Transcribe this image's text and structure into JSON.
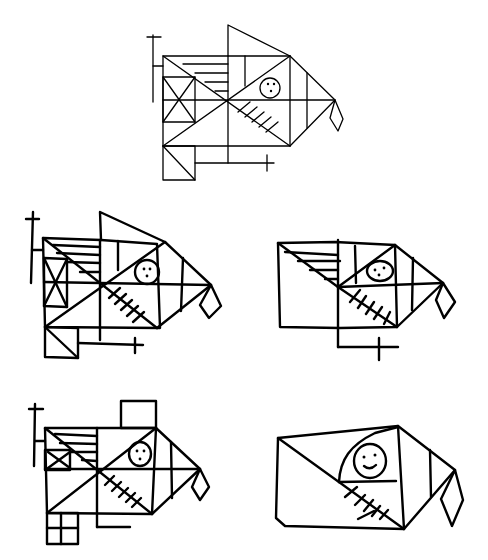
{
  "figure": {
    "title": "",
    "stroke_color": "#000000",
    "background": "#ffffff",
    "panels": [
      {
        "id": "model",
        "label": "",
        "position": "top-center",
        "style": "thin"
      },
      {
        "id": "copy-1",
        "label": "",
        "position": "middle-left",
        "style": "thick"
      },
      {
        "id": "copy-2",
        "label": "",
        "position": "middle-right",
        "style": "thick"
      },
      {
        "id": "copy-3",
        "label": "",
        "position": "bottom-left",
        "style": "thick"
      },
      {
        "id": "copy-4",
        "label": "",
        "position": "bottom-right",
        "style": "thick"
      }
    ]
  }
}
